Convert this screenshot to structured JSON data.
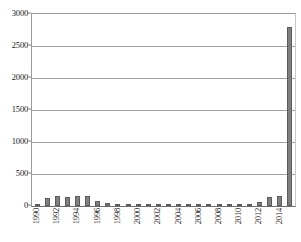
{
  "chart_data": {
    "type": "bar",
    "title": "",
    "subtitle": "",
    "xlabel": "",
    "ylabel": "",
    "ylim": [
      0,
      3000
    ],
    "y_ticks": [
      0,
      500,
      1000,
      1500,
      2000,
      2500,
      3000
    ],
    "y_tick_labels": [
      "0",
      "500",
      "1000",
      "1500",
      "2000",
      "2500",
      "3000"
    ],
    "grid": true,
    "legend": false,
    "legend_position": "none",
    "bar_color": "#7f7f7f",
    "bar_edge_color": "#5c5c5c",
    "gridline_color": "#9e9e9e",
    "axis_color": "#6e6e6e",
    "x_tick_label_interval": 2,
    "x_tick_label_rotation": -90,
    "categories": [
      "1990",
      "1991",
      "1992",
      "1993",
      "1994",
      "1995",
      "1996",
      "1997",
      "1998",
      "1999",
      "2000",
      "2001",
      "2002",
      "2003",
      "2004",
      "2005",
      "2006",
      "2007",
      "2008",
      "2009",
      "2010",
      "2011",
      "2012",
      "2013",
      "2014",
      "2015"
    ],
    "x_tick_labels_shown": [
      "1990",
      "",
      "1992",
      "",
      "1994",
      "",
      "1996",
      "",
      "1998",
      "",
      "2000",
      "",
      "2002",
      "",
      "2004",
      "",
      "2006",
      "",
      "2008",
      "",
      "2010",
      "",
      "2012",
      "",
      "2014",
      ""
    ],
    "values": [
      20,
      120,
      150,
      145,
      150,
      155,
      85,
      40,
      30,
      25,
      25,
      20,
      15,
      15,
      15,
      15,
      15,
      20,
      25,
      20,
      20,
      35,
      65,
      140,
      160,
      2800
    ]
  }
}
